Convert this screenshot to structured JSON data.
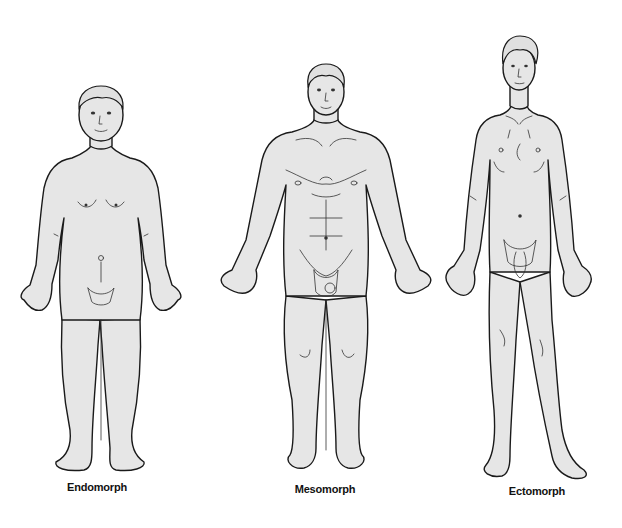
{
  "diagram": {
    "type": "somatotype-illustration",
    "style": {
      "skin_fill": "#e6e6e6",
      "line_color": "#1a1a1a",
      "background": "#ffffff"
    },
    "figures": [
      {
        "id": "endomorph",
        "label": "Endomorph",
        "label_x": 97,
        "label_y": 487
      },
      {
        "id": "mesomorph",
        "label": "Mesomorph",
        "label_x": 325,
        "label_y": 489
      },
      {
        "id": "ectomorph",
        "label": "Ectomorph",
        "label_x": 537,
        "label_y": 491
      }
    ]
  }
}
